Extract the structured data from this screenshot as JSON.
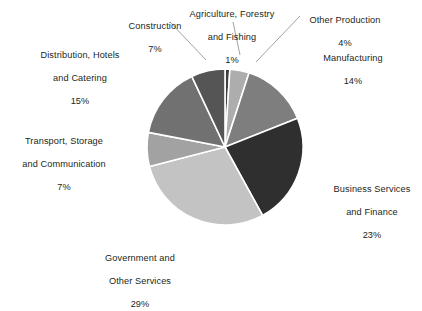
{
  "chart_data": {
    "type": "pie",
    "title": "",
    "subtitle": "",
    "xlabel": "",
    "ylabel": "",
    "legend_position": "none",
    "grid": false,
    "units": "percent",
    "label_format": "name + percent",
    "total": 100,
    "start_angle_deg": 0,
    "direction": "clockwise",
    "categories": [
      "Agriculture, Forestry and Fishing",
      "Other Production",
      "Manufacturing",
      "Business Services and Finance",
      "Government and Other Services",
      "Transport, Storage and Communication",
      "Distribution, Hotels and Catering",
      "Construction"
    ],
    "values": [
      1,
      4,
      14,
      23,
      29,
      7,
      15,
      7
    ],
    "slices": [
      {
        "id": "agriculture",
        "name_line1": "Agriculture, Forestry",
        "name_line2": "and Fishing",
        "percent_label": "1%",
        "value": 1,
        "color": "#3f3f3f",
        "leader": false
      },
      {
        "id": "other-production",
        "name_line1": "Other Production",
        "name_line2": "",
        "percent_label": "4%",
        "value": 4,
        "color": "#adadad",
        "leader": true
      },
      {
        "id": "manufacturing",
        "name_line1": "Manufacturing",
        "name_line2": "",
        "percent_label": "14%",
        "value": 14,
        "color": "#7e7e7e",
        "leader": false
      },
      {
        "id": "business-services",
        "name_line1": "Business Services",
        "name_line2": "and Finance",
        "percent_label": "23%",
        "value": 23,
        "color": "#2f2f2f",
        "leader": false
      },
      {
        "id": "government",
        "name_line1": "Government and",
        "name_line2": "Other Services",
        "percent_label": "29%",
        "value": 29,
        "color": "#c3c3c3",
        "leader": false
      },
      {
        "id": "transport",
        "name_line1": "Transport, Storage",
        "name_line2": "and Communication",
        "percent_label": "7%",
        "value": 7,
        "color": "#a2a2a2",
        "leader": false
      },
      {
        "id": "distribution",
        "name_line1": "Distribution, Hotels",
        "name_line2": "and Catering",
        "percent_label": "15%",
        "value": 15,
        "color": "#717171",
        "leader": false
      },
      {
        "id": "construction",
        "name_line1": "Construction",
        "name_line2": "",
        "percent_label": "7%",
        "value": 7,
        "color": "#555555",
        "leader": true
      }
    ],
    "separator_color": "#ffffff",
    "background_color": "#ffffff",
    "text_color": "#231f20"
  }
}
